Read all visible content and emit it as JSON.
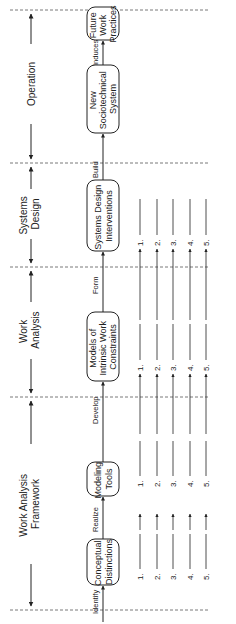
{
  "phases": [
    {
      "label_lines": [
        "Work Analysis",
        "Framework"
      ]
    },
    {
      "label_lines": [
        "Work",
        "Analysis"
      ]
    },
    {
      "label_lines": [
        "Systems",
        "Design"
      ]
    },
    {
      "label_lines": [
        "Operation"
      ]
    }
  ],
  "boxes": [
    {
      "label_lines": [
        "Conceptual",
        "Distinctions"
      ]
    },
    {
      "label_lines": [
        "Modeling",
        "Tools"
      ]
    },
    {
      "label_lines": [
        "Models of",
        "Intrinsic Work",
        "Constraints"
      ]
    },
    {
      "label_lines": [
        "Systems Design",
        "Interventions"
      ]
    },
    {
      "label_lines": [
        "New",
        "Sociotechnical",
        "System"
      ]
    },
    {
      "label_lines": [
        "Future",
        "Work",
        "Practices"
      ]
    }
  ],
  "connectors": [
    "Identify",
    "Realize",
    "Develop",
    "Form",
    "Build",
    "Induces"
  ],
  "list_numbers": [
    "1.",
    "2.",
    "3.",
    "4.",
    "5."
  ],
  "colors": {
    "line": "#222222",
    "dash": "#555555",
    "background": "#ffffff"
  }
}
